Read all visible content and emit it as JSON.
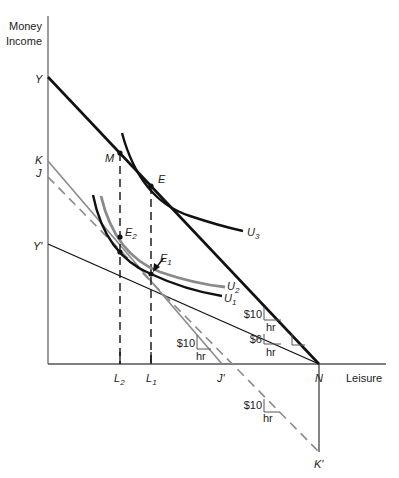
{
  "diagram": {
    "axes": {
      "y_label_line1": "Money",
      "y_label_line2": "Income",
      "x_label": "Leisure"
    },
    "points": {
      "Y": "Y",
      "K": "K",
      "J": "J",
      "Y_prime": "Y'",
      "M": "M",
      "E": "E",
      "E2": "E",
      "E2_sub": "2",
      "E1": "E",
      "E1_sub": "1",
      "L2": "L",
      "L2_sub": "2",
      "L1": "L",
      "L1_sub": "1",
      "J_prime": "J'",
      "N": "N",
      "K_prime": "K'"
    },
    "curves": {
      "U3": "U",
      "U3_sub": "3",
      "U2": "U",
      "U2_sub": "2",
      "U1": "U",
      "U1_sub": "1"
    },
    "slope_markers": [
      {
        "value": "$10",
        "unit": "hr",
        "line": "YN"
      },
      {
        "value": "$6",
        "unit": "hr",
        "line": "Y'N"
      },
      {
        "value": "$10",
        "unit": "hr",
        "line": "KJ'"
      },
      {
        "value": "$10",
        "unit": "hr",
        "line": "JK'"
      }
    ],
    "colors": {
      "black": "#111111",
      "grey": "#8a8a8a",
      "axis": "#555555"
    }
  }
}
